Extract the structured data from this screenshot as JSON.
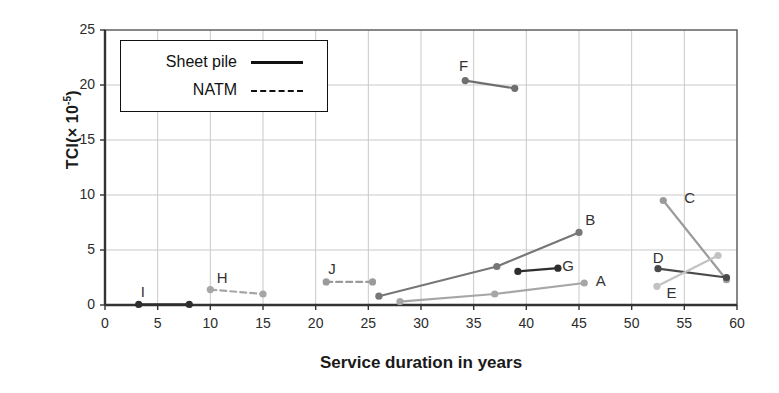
{
  "chart_data": {
    "type": "line",
    "title": "",
    "xlabel": "Service duration in years",
    "ylabel": "TCI(× 10-5)",
    "ylabel_base": "TCI(× 10",
    "ylabel_exp": "-5",
    "ylabel_close": ")",
    "xlim": [
      0,
      60
    ],
    "ylim": [
      0,
      25
    ],
    "xticks": [
      "0",
      "5",
      "10",
      "15",
      "20",
      "25",
      "30",
      "35",
      "40",
      "45",
      "50",
      "55",
      "60"
    ],
    "yticks": [
      "0",
      "5",
      "10",
      "15",
      "20",
      "25"
    ],
    "grid": true,
    "legend_position": "upper-left-inside",
    "legend": [
      {
        "label": "Sheet pile",
        "style": "solid"
      },
      {
        "label": "NATM",
        "style": "dashed"
      }
    ],
    "series": [
      {
        "name": "A",
        "style": "solid",
        "color": "#a6a6a6",
        "label_x": 46.6,
        "label_y": 2.1,
        "points": [
          [
            28.0,
            0.3
          ],
          [
            37.0,
            1.0
          ],
          [
            45.5,
            2.0
          ]
        ]
      },
      {
        "name": "B",
        "style": "solid",
        "color": "#777777",
        "label_x": 45.6,
        "label_y": 7.6,
        "points": [
          [
            26.0,
            0.8
          ],
          [
            37.2,
            3.5
          ],
          [
            45.0,
            6.6
          ]
        ]
      },
      {
        "name": "C",
        "style": "solid",
        "color": "#9b9b9b",
        "label_x": 55.0,
        "label_y": 9.6,
        "points": [
          [
            53.0,
            9.5
          ],
          [
            59.0,
            2.3
          ]
        ]
      },
      {
        "name": "D",
        "style": "solid",
        "color": "#4a4a4a",
        "label_x": 52.0,
        "label_y": 4.2,
        "points": [
          [
            52.5,
            3.3
          ],
          [
            59.0,
            2.5
          ]
        ]
      },
      {
        "name": "E",
        "style": "solid",
        "color": "#c2c2c2",
        "label_x": 53.3,
        "label_y": 1.0,
        "points": [
          [
            52.4,
            1.7
          ],
          [
            58.2,
            4.5
          ]
        ]
      },
      {
        "name": "F",
        "style": "solid",
        "color": "#6e6e6e",
        "label_x": 33.6,
        "label_y": 21.6,
        "points": [
          [
            34.2,
            20.4
          ],
          [
            38.9,
            19.7
          ]
        ]
      },
      {
        "name": "G",
        "style": "solid",
        "color": "#2e2e2e",
        "label_x": 43.4,
        "label_y": 3.5,
        "points": [
          [
            39.2,
            3.05
          ],
          [
            43.0,
            3.35
          ]
        ]
      },
      {
        "name": "H",
        "style": "dashed",
        "color": "#a6a6a6",
        "label_x": 10.6,
        "label_y": 2.4,
        "points": [
          [
            10.0,
            1.4
          ],
          [
            15.0,
            1.0
          ]
        ]
      },
      {
        "name": "I",
        "style": "solid",
        "color": "#2e2e2e",
        "label_x": 3.4,
        "label_y": 1.1,
        "points": [
          [
            3.2,
            0.05
          ],
          [
            8.0,
            0.05
          ]
        ]
      },
      {
        "name": "J",
        "style": "dashed",
        "color": "#9b9b9b",
        "label_x": 21.2,
        "label_y": 3.2,
        "points": [
          [
            21.0,
            2.1
          ],
          [
            25.4,
            2.1
          ]
        ]
      }
    ]
  }
}
